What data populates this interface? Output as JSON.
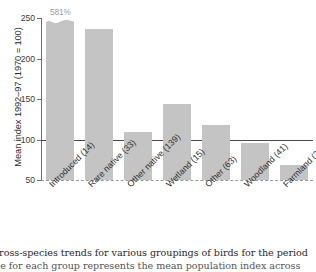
{
  "chart_data": {
    "type": "bar",
    "title": "",
    "subtitle": "",
    "xlabel": "",
    "ylabel": "Mean index 1992–97 (1970 = 100)",
    "ylim": [
      50,
      250
    ],
    "yticks": [
      250,
      200,
      150,
      100,
      50
    ],
    "ytick_labels": [
      "250",
      "200",
      "150",
      "100",
      "50"
    ],
    "grid": false,
    "legend": null,
    "categories": [
      "Introduced (14)",
      "Rare native (33)",
      "Other native (139)",
      "Wetland (15)",
      "Other (63)",
      "Woodland (41)",
      "Farmland (20)"
    ],
    "values": [
      581,
      236,
      109,
      144,
      118,
      96,
      69
    ],
    "bar_color": "#c4c4c4",
    "annotations": [
      {
        "target_category": "Introduced (14)",
        "text": "581%",
        "note": "bar axis-truncated, drawn with broken wavy top"
      }
    ],
    "reference_lines": [
      {
        "value": 100,
        "style": "solid",
        "color": "#4a4a4a"
      },
      {
        "value": 50,
        "style": "dashed",
        "color": "#9a9a9a"
      }
    ]
  },
  "axis": {
    "y_title": "Mean index 1992–97 (1970 = 100)",
    "tick_labels": [
      "250",
      "200",
      "150",
      "100",
      "50"
    ]
  },
  "bars": [
    {
      "label": "Introduced (14)",
      "value": 581,
      "value_label": "581%",
      "truncated": true
    },
    {
      "label": "Rare native (33)",
      "value": 236,
      "value_label": "",
      "truncated": false
    },
    {
      "label": "Other native (139)",
      "value": 109,
      "value_label": "",
      "truncated": false
    },
    {
      "label": "Wetland (15)",
      "value": 144,
      "value_label": "",
      "truncated": false
    },
    {
      "label": "Other (63)",
      "value": 118,
      "value_label": "",
      "truncated": false
    },
    {
      "label": "Woodland (41)",
      "value": 96,
      "value_label": "",
      "truncated": false
    },
    {
      "label": "Farmland (20)",
      "value": 69,
      "value_label": "",
      "truncated": false
    }
  ],
  "caption": {
    "line1": "n, across-species trends for various groupings of birds for the period",
    "line2": "value for each group represents the mean population index across"
  }
}
